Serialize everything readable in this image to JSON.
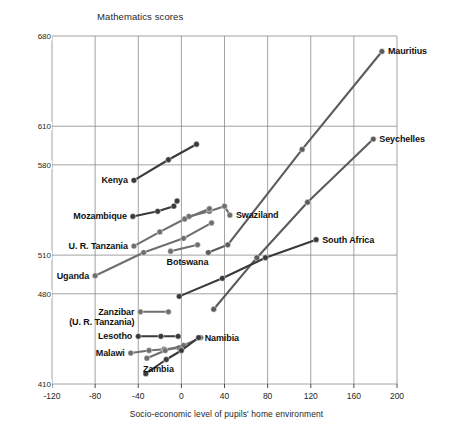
{
  "chart_data": {
    "type": "line",
    "title": "Mathematics scores",
    "xlabel": "Socio-economic level of pupils' home environment",
    "ylabel": "",
    "xlim": [
      -120,
      200
    ],
    "ylim": [
      410,
      680
    ],
    "xticks": [
      -120,
      -80,
      -40,
      0,
      40,
      80,
      120,
      160,
      200
    ],
    "yticks": [
      410,
      480,
      510,
      580,
      610,
      680
    ],
    "grid": true,
    "legend_position": "none",
    "accent_color": "#6f6f6f",
    "dark_color": "#3a3a3a",
    "series": [
      {
        "name": "Mauritius",
        "color": "#5c5c5c",
        "label_side": "right",
        "points": [
          {
            "x": 25,
            "y": 512
          },
          {
            "x": 43,
            "y": 518
          },
          {
            "x": 112,
            "y": 592
          },
          {
            "x": 186,
            "y": 668
          }
        ]
      },
      {
        "name": "Seychelles",
        "color": "#5c5c5c",
        "label_side": "right",
        "points": [
          {
            "x": 30,
            "y": 468
          },
          {
            "x": 70,
            "y": 508
          },
          {
            "x": 117,
            "y": 551
          },
          {
            "x": 178,
            "y": 600
          }
        ]
      },
      {
        "name": "South Africa",
        "color": "#3a3a3a",
        "label_side": "right",
        "points": [
          {
            "x": -2,
            "y": 478
          },
          {
            "x": 38,
            "y": 492
          },
          {
            "x": 78,
            "y": 508
          },
          {
            "x": 125,
            "y": 522
          }
        ]
      },
      {
        "name": "Kenya",
        "color": "#3a3a3a",
        "label_side": "left",
        "points": [
          {
            "x": -44,
            "y": 568
          },
          {
            "x": -12,
            "y": 584
          },
          {
            "x": 14,
            "y": 596
          }
        ]
      },
      {
        "name": "Mozambique",
        "color": "#3a3a3a",
        "label_side": "left",
        "points": [
          {
            "x": -45,
            "y": 540
          },
          {
            "x": -22,
            "y": 544
          },
          {
            "x": -7,
            "y": 548
          },
          {
            "x": -4,
            "y": 552
          }
        ]
      },
      {
        "name": "Swaziland",
        "color": "#6f6f6f",
        "label_side": "right",
        "points": [
          {
            "x": 7,
            "y": 540
          },
          {
            "x": 26,
            "y": 544
          },
          {
            "x": 40,
            "y": 548
          },
          {
            "x": 45,
            "y": 541
          }
        ]
      },
      {
        "name": "U. R. Tanzania",
        "color": "#6f6f6f",
        "label_side": "left",
        "points": [
          {
            "x": -44,
            "y": 517
          },
          {
            "x": -20,
            "y": 528
          },
          {
            "x": 3,
            "y": 538
          },
          {
            "x": 26,
            "y": 546
          }
        ]
      },
      {
        "name": "Uganda",
        "color": "#6f6f6f",
        "label_side": "left",
        "points": [
          {
            "x": -80,
            "y": 494
          },
          {
            "x": -35,
            "y": 512
          },
          {
            "x": 2,
            "y": 523
          },
          {
            "x": 28,
            "y": 535
          }
        ]
      },
      {
        "name": "Botswana",
        "color": "#6f6f6f",
        "label_side": "below",
        "points": [
          {
            "x": -10,
            "y": 513
          },
          {
            "x": 15,
            "y": 518
          }
        ]
      },
      {
        "name": "Zanzibar (U. R. Tanzania)",
        "color": "#6f6f6f",
        "label_side": "left2",
        "points": [
          {
            "x": -38,
            "y": 466
          },
          {
            "x": -12,
            "y": 466
          }
        ]
      },
      {
        "name": "Lesotho",
        "color": "#3a3a3a",
        "label_side": "left",
        "points": [
          {
            "x": -40,
            "y": 447
          },
          {
            "x": -19,
            "y": 447
          },
          {
            "x": -3,
            "y": 447
          }
        ]
      },
      {
        "name": "Malawi",
        "color": "#6f6f6f",
        "label_side": "left",
        "points": [
          {
            "x": -47,
            "y": 434
          },
          {
            "x": -30,
            "y": 436
          },
          {
            "x": -16,
            "y": 437
          },
          {
            "x": -2,
            "y": 438
          }
        ]
      },
      {
        "name": "Zambia",
        "color": "#6f6f6f",
        "label_side": "below",
        "points": [
          {
            "x": -32,
            "y": 430
          },
          {
            "x": -15,
            "y": 436
          },
          {
            "x": 2,
            "y": 440
          },
          {
            "x": 18,
            "y": 446
          }
        ]
      },
      {
        "name": "Namibia",
        "color": "#3a3a3a",
        "label_side": "right",
        "points": [
          {
            "x": -33,
            "y": 418
          },
          {
            "x": -14,
            "y": 429
          },
          {
            "x": 0,
            "y": 436
          },
          {
            "x": 16,
            "y": 446
          }
        ]
      }
    ]
  }
}
